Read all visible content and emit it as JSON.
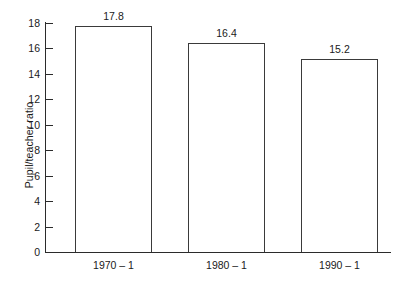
{
  "chart_data": {
    "type": "bar",
    "title": "",
    "subtitle": "",
    "xlabel": "",
    "ylabel": "Pupil/teacher ratio",
    "categories": [
      "1970 – 1",
      "1980 – 1",
      "1990 – 1"
    ],
    "values": [
      17.8,
      16.4,
      15.2
    ],
    "data_labels": [
      "17.8",
      "16.4",
      "15.2"
    ],
    "ylim": [
      0,
      18
    ],
    "ytick_values": [
      18,
      16,
      14,
      12,
      10,
      8,
      6,
      4,
      2,
      0
    ],
    "ytick_labels": [
      "18",
      "16",
      "14",
      "12",
      "10",
      "8",
      "6",
      "4",
      "2",
      "0"
    ],
    "xtick_labels": [
      "1970 – 1",
      "1980 – 1",
      "1990 – 1"
    ],
    "grid": false,
    "legend": false,
    "legend_position": "none",
    "series": [
      {
        "name": "Pupil/teacher ratio",
        "values": [
          17.8,
          16.4,
          15.2
        ]
      }
    ],
    "colors": {
      "bar_fill": "#ffffff",
      "bar_outline": "#3a3a3a",
      "axis": "#2b2b2b",
      "text": "#1a1a1a",
      "background": "#ffffff"
    }
  }
}
